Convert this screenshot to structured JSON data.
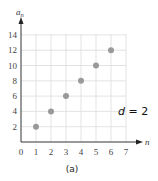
{
  "chart_data": {
    "type": "scatter",
    "title": "",
    "caption": "(a)",
    "xlabel": "n",
    "ylabel": "a_n",
    "xlim": [
      0,
      7
    ],
    "ylim": [
      0,
      14
    ],
    "xticks": [
      "0",
      "1",
      "2",
      "3",
      "4",
      "5",
      "6",
      "7"
    ],
    "yticks": [
      "2",
      "4",
      "6",
      "8",
      "10",
      "12",
      "14"
    ],
    "grid": true,
    "series": [
      {
        "name": "a_n",
        "x": [
          1,
          2,
          3,
          4,
          5,
          6
        ],
        "y": [
          2,
          4,
          6,
          8,
          10,
          12
        ],
        "color": "#999999"
      }
    ],
    "annotations": [
      {
        "text": "d = 2",
        "x": 6.6,
        "y": 4
      }
    ]
  },
  "labels": {
    "ylabel_main": "a",
    "ylabel_sub": "n",
    "xlabel": "n",
    "annotation_d": "d",
    "annotation_rest": " = 2",
    "caption": "(a)"
  }
}
